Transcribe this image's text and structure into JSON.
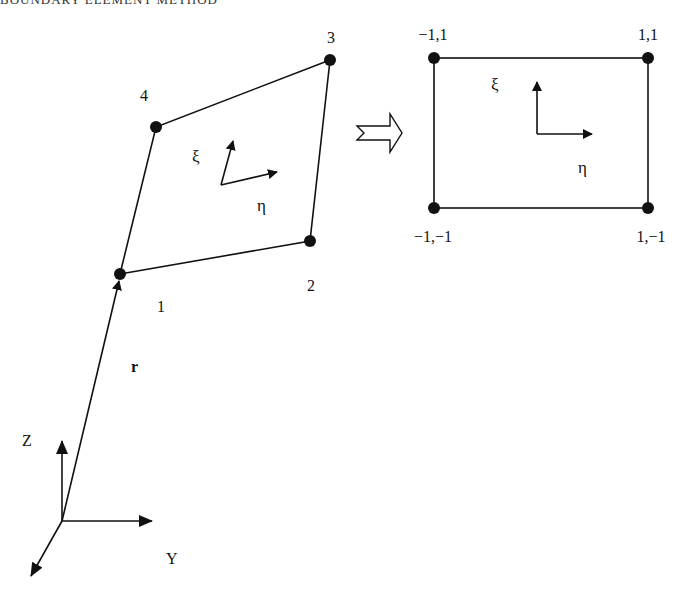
{
  "header": {
    "running_title": "BOUNDARY ELEMENT METHOD"
  },
  "colors": {
    "ink": "#111111",
    "background": "#ffffff"
  },
  "diagram": {
    "global_axes": {
      "origin": [
        62,
        521
      ],
      "z_label": "Z",
      "y_label": "Y",
      "x_label": ""
    },
    "position_vector": {
      "label": "r"
    },
    "quadrilateral": {
      "nodes": [
        {
          "id": "1",
          "label": "1",
          "x": 120,
          "y": 274
        },
        {
          "id": "2",
          "label": "2",
          "x": 310,
          "y": 241
        },
        {
          "id": "3",
          "label": "3",
          "x": 330,
          "y": 60
        },
        {
          "id": "4",
          "label": "4",
          "x": 156,
          "y": 127
        }
      ],
      "local_axes": {
        "xi_label": "ξ",
        "eta_label": "η"
      }
    },
    "mapping_arrow": {
      "type": "hollow-arrow",
      "direction": "right"
    },
    "reference_square": {
      "corners": [
        {
          "label": "−1,1",
          "x": 434,
          "y": 58
        },
        {
          "label": "1,1",
          "x": 648,
          "y": 58
        },
        {
          "label": "−1,−1",
          "x": 434,
          "y": 208
        },
        {
          "label": "1,−1",
          "x": 648,
          "y": 208
        }
      ],
      "local_axes": {
        "xi_label": "ξ",
        "eta_label": "η"
      }
    }
  }
}
